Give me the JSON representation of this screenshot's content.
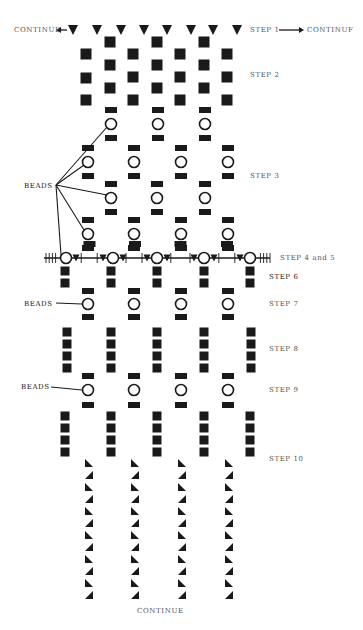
{
  "colors": {
    "ink": "#1a1a1a",
    "label": "#555555",
    "background": "#ffffff"
  },
  "labels": {
    "continue_left": "CONTINUE",
    "continue_right": "CONTINUF",
    "continue_bottom": "CONTINUE",
    "beads_step3": "BEADS",
    "beads_step7": "BEADS",
    "beads_step9": "BEADS",
    "steps": [
      {
        "id": "step1",
        "label": "STEP 1"
      },
      {
        "id": "step2",
        "label": "STEP 2"
      },
      {
        "id": "step3",
        "label": "STEP 3"
      },
      {
        "id": "step45",
        "label": "STEP 4 and 5"
      },
      {
        "id": "step6",
        "label": "STEP 6"
      },
      {
        "id": "step7",
        "label": "STEP 7"
      },
      {
        "id": "step8",
        "label": "STEP 8"
      },
      {
        "id": "step9",
        "label": "STEP 9"
      },
      {
        "id": "step10",
        "label": "STEP 10"
      }
    ]
  },
  "symbols": {
    "step1_triangles_x": [
      73,
      97,
      121,
      144,
      167,
      191,
      213,
      237
    ],
    "step1_y": 30,
    "step2_squares": [
      {
        "x": 86,
        "ys": [
          54,
          78,
          100
        ]
      },
      {
        "x": 110,
        "ys": [
          42,
          65,
          88
        ]
      },
      {
        "x": 133,
        "ys": [
          54,
          77,
          100
        ]
      },
      {
        "x": 157,
        "ys": [
          42,
          65,
          88
        ]
      },
      {
        "x": 180,
        "ys": [
          54,
          77,
          100
        ]
      },
      {
        "x": 204,
        "ys": [
          42,
          65,
          88
        ]
      },
      {
        "x": 227,
        "ys": [
          54,
          77,
          100
        ]
      }
    ],
    "step3_bead_rows": [
      {
        "y": 124,
        "xs": [
          111,
          158,
          205
        ]
      },
      {
        "y": 162,
        "xs": [
          88,
          134,
          181,
          228
        ]
      },
      {
        "y": 198,
        "xs": [
          111,
          157,
          205
        ]
      },
      {
        "y": 234,
        "xs": [
          88,
          134,
          181,
          228
        ]
      }
    ],
    "step45_line": {
      "y": 258,
      "x1": 44,
      "x2": 270,
      "bead_xs": [
        66,
        113,
        157,
        204,
        250
      ]
    },
    "step6_columns_x": [
      65,
      111,
      157,
      204,
      250
    ],
    "step6_ys": [
      271,
      283
    ],
    "step7_beads": {
      "y": 304,
      "xs": [
        88,
        134,
        181,
        228
      ]
    },
    "step8_columns_x": [
      67,
      111,
      157,
      204,
      251
    ],
    "step8_ys": [
      332,
      344,
      356,
      368
    ],
    "step9_beads": {
      "y": 390,
      "xs": [
        88,
        134,
        181,
        228
      ]
    },
    "step10_columns_x": [
      65,
      111,
      157,
      204,
      250
    ],
    "step10_ys": [
      416,
      428,
      440,
      452
    ],
    "tail_triangle_columns_x": [
      89,
      135,
      182,
      229
    ],
    "tail_triangle_count": 12,
    "tail_start_y": 463,
    "tail_spacing": 12
  }
}
